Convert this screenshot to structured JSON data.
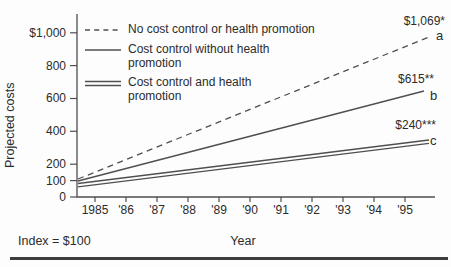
{
  "figure": {
    "y_axis_title": "Projected costs",
    "x_axis_title": "Year",
    "footnote": "Index = $100"
  },
  "legend": [
    {
      "style": "dashed",
      "label": "No cost control or health promotion"
    },
    {
      "style": "solid",
      "label": "Cost control without health promotion"
    },
    {
      "style": "double",
      "label": "Cost control and health promotion"
    }
  ],
  "annotations": [
    {
      "value": "$1,069*",
      "letter": "a"
    },
    {
      "value": "$615**",
      "letter": "b"
    },
    {
      "value": "$240***",
      "letter": "c"
    }
  ],
  "chart_data": {
    "type": "line",
    "title": "",
    "xlabel": "Year",
    "ylabel": "Projected costs",
    "index_note": "Index = $100",
    "x_ticks": [
      "1985",
      "'86",
      "'87",
      "'88",
      "'89",
      "'90",
      "'91",
      "'92",
      "'93",
      "'94",
      "'95"
    ],
    "y_ticks": [
      "$1,000",
      "800",
      "600",
      "400",
      "200",
      "100",
      "0"
    ],
    "y_tick_values": [
      1000,
      800,
      600,
      400,
      200,
      100,
      0
    ],
    "ylim": [
      0,
      1100
    ],
    "grid": false,
    "legend_position": "top-left-inside",
    "series": [
      {
        "name": "No cost control or health promotion",
        "line_style": "dashed",
        "x": [
          1985,
          1995
        ],
        "values": [
          100,
          1069
        ],
        "end_label": "$1,069*",
        "letter": "a"
      },
      {
        "name": "Cost control without health promotion",
        "line_style": "solid",
        "x": [
          1985,
          1995
        ],
        "values": [
          100,
          615
        ],
        "end_label": "$615**",
        "letter": "b"
      },
      {
        "name": "Cost control and health promotion",
        "line_style": "double",
        "x": [
          1985,
          1995
        ],
        "values": [
          100,
          240
        ],
        "end_label": "$240***",
        "letter": "c"
      }
    ],
    "line_color": "#4f4f4f",
    "text_color": "#2b2b2b"
  }
}
